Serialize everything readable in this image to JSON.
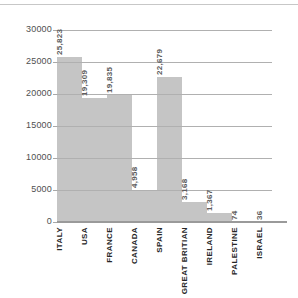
{
  "chart_data": {
    "type": "bar",
    "title": "",
    "xlabel": "",
    "ylabel": "",
    "categories": [
      "ITALY",
      "USA",
      "FRANCE",
      "CANADA",
      "SPAIN",
      "GREAT BRITIAN",
      "IRELAND",
      "PALESTINE",
      "ISRAEL"
    ],
    "values": [
      25823,
      19309,
      19835,
      4958,
      22679,
      3168,
      1367,
      74,
      36
    ],
    "value_labels": [
      "25,823",
      "19,309",
      "19,835",
      "4,958",
      "22,679",
      "3,168",
      "1,367",
      "74",
      "36"
    ],
    "ylim": [
      0,
      30000
    ],
    "yticks": [
      0,
      5000,
      10000,
      15000,
      20000,
      25000,
      30000
    ],
    "grid": "horizontal",
    "legend": "none",
    "bar_color": "#c5c5c5",
    "gridline_color": "#b0b0b0",
    "baseline_color": "#9a9a9a"
  }
}
